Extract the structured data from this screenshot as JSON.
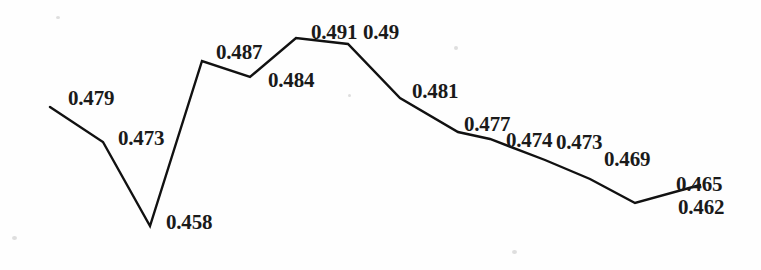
{
  "chart_data": {
    "type": "line",
    "title": "",
    "subtitle": "",
    "xlabel": "",
    "ylabel": "",
    "grid": false,
    "legend": false,
    "axes_visible": false,
    "x": [
      1,
      2,
      3,
      4,
      5,
      6,
      7,
      8,
      9,
      10,
      11,
      12,
      13
    ],
    "values": [
      0.479,
      0.473,
      0.458,
      0.487,
      0.484,
      0.491,
      0.49,
      0.481,
      0.477,
      0.474,
      0.473,
      0.462,
      0.465
    ],
    "point_labels": [
      "0.479",
      "0.473",
      "0.458",
      "0.487",
      "0.484",
      "0.491",
      "0.49",
      "0.481",
      "0.477",
      "0.474",
      "0.473",
      "0.469",
      "0.462",
      "0.465"
    ],
    "ylim": [
      0.455,
      0.493
    ],
    "line_color": "#111111",
    "line_width": 2.4,
    "points": [
      {
        "label": "0.479",
        "value": 0.479,
        "px": 50,
        "py": 107,
        "lx": 68,
        "ly": 88
      },
      {
        "label": "0.473",
        "value": 0.473,
        "px": 103,
        "py": 142,
        "lx": 118,
        "ly": 128
      },
      {
        "label": "0.458",
        "value": 0.458,
        "px": 150,
        "py": 226,
        "lx": 166,
        "ly": 212
      },
      {
        "label": "0.487",
        "value": 0.487,
        "px": 202,
        "py": 61,
        "lx": 216,
        "ly": 42
      },
      {
        "label": "0.484",
        "value": 0.484,
        "px": 250,
        "py": 77,
        "lx": 268,
        "ly": 70
      },
      {
        "label": "0.491",
        "value": 0.491,
        "px": 296,
        "py": 38,
        "lx": 311,
        "ly": 22
      },
      {
        "label": "0.49",
        "value": 0.49,
        "px": 348,
        "py": 44,
        "lx": 363,
        "ly": 22
      },
      {
        "label": "0.481",
        "value": 0.481,
        "px": 400,
        "py": 98,
        "lx": 412,
        "ly": 81
      },
      {
        "label": "0.477",
        "value": 0.477,
        "px": 458,
        "py": 132,
        "lx": 464,
        "ly": 114
      },
      {
        "label": "0.474",
        "value": 0.474,
        "px": 490,
        "py": 139,
        "lx": 506,
        "ly": 130
      },
      {
        "label": "0.473",
        "value": 0.473,
        "px": 545,
        "py": 160,
        "lx": 556,
        "ly": 132
      },
      {
        "label": "0.469",
        "value": 0.469,
        "px": 590,
        "py": 179,
        "lx": 604,
        "ly": 149
      },
      {
        "label": "0.462",
        "value": 0.462,
        "px": 635,
        "py": 203,
        "lx": 678,
        "ly": 197
      },
      {
        "label": "0.465",
        "value": 0.465,
        "px": 700,
        "py": 185,
        "lx": 676,
        "ly": 174
      }
    ],
    "polyline": "50,107 103,142 150,226 202,61 250,77 296,38 348,44 400,98 458,132 490,139 545,160 590,179 635,203 700,185"
  }
}
